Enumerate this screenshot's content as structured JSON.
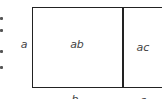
{
  "diagram": {
    "type": "area-model",
    "side_label_left": "a",
    "bottom_labels": [
      "b",
      "c"
    ],
    "cells": [
      {
        "label": "ab"
      },
      {
        "label": "ac"
      }
    ],
    "colors": {
      "stroke": "#222222",
      "text": "#444444"
    }
  }
}
